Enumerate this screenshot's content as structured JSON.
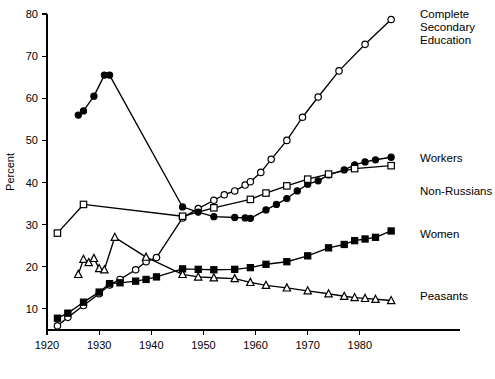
{
  "chart_data": {
    "type": "line",
    "title": "",
    "xlabel": "",
    "ylabel": "Percent",
    "xlim": [
      1920,
      1990
    ],
    "ylim": [
      5,
      80
    ],
    "xticks": [
      1920,
      1930,
      1940,
      1950,
      1960,
      1970,
      1980
    ],
    "xtick_labels": [
      "1920",
      "1930",
      "1940",
      "1950",
      "1960",
      "1970",
      "1980"
    ],
    "yticks": [
      10,
      20,
      30,
      40,
      50,
      60,
      70,
      80
    ],
    "ytick_labels": [
      "10",
      "20",
      "30",
      "40",
      "50",
      "60",
      "70",
      "80"
    ],
    "grid": false,
    "legend_position": "right-inline-labels",
    "series": [
      {
        "name": "Complete Secondary Education",
        "marker": "open-circle",
        "label": "Complete Secondary Education",
        "label_lines": [
          "Complete",
          "Secondary",
          "Education"
        ],
        "points": [
          [
            1922,
            6.0
          ],
          [
            1924,
            8.0
          ],
          [
            1927,
            10.8
          ],
          [
            1930,
            13.6
          ],
          [
            1932,
            15.7
          ],
          [
            1934,
            17.0
          ],
          [
            1937,
            19.3
          ],
          [
            1939,
            21.2
          ],
          [
            1941,
            22.2
          ],
          [
            1946,
            31.6
          ],
          [
            1949,
            33.8
          ],
          [
            1952,
            35.8
          ],
          [
            1954,
            37.1
          ],
          [
            1956,
            38.0
          ],
          [
            1958,
            39.4
          ],
          [
            1959,
            40.2
          ],
          [
            1961,
            42.4
          ],
          [
            1963,
            45.5
          ],
          [
            1966,
            50.0
          ],
          [
            1969,
            55.5
          ],
          [
            1972,
            60.3
          ],
          [
            1976,
            66.5
          ],
          [
            1981,
            72.8
          ],
          [
            1986,
            78.7
          ]
        ]
      },
      {
        "name": "Workers",
        "marker": "filled-circle",
        "label": "Workers",
        "label_lines": [
          "Workers"
        ],
        "points": [
          [
            1926,
            56.0
          ],
          [
            1927,
            57.0
          ],
          [
            1929,
            60.5
          ],
          [
            1931,
            65.5
          ],
          [
            1932,
            65.5
          ],
          [
            1946,
            34.2
          ],
          [
            1949,
            33.0
          ],
          [
            1952,
            31.9
          ],
          [
            1956,
            31.7
          ],
          [
            1958,
            31.6
          ],
          [
            1959,
            31.5
          ],
          [
            1962,
            33.5
          ],
          [
            1964,
            34.8
          ],
          [
            1966,
            36.2
          ],
          [
            1968,
            38.0
          ],
          [
            1970,
            39.6
          ],
          [
            1972,
            40.4
          ],
          [
            1974,
            41.8
          ],
          [
            1977,
            43.0
          ],
          [
            1979,
            44.2
          ],
          [
            1981,
            44.9
          ],
          [
            1983,
            45.4
          ],
          [
            1986,
            46.0
          ]
        ]
      },
      {
        "name": "Non-Russians",
        "marker": "open-square",
        "label": "Non-Russians",
        "label_lines": [
          "Non-Russians"
        ],
        "points": [
          [
            1922,
            28.0
          ],
          [
            1927,
            34.8
          ],
          [
            1946,
            32.0
          ],
          [
            1952,
            34.0
          ],
          [
            1959,
            36.0
          ],
          [
            1962,
            37.5
          ],
          [
            1966,
            39.2
          ],
          [
            1970,
            40.8
          ],
          [
            1974,
            42.0
          ],
          [
            1979,
            43.3
          ],
          [
            1986,
            44.0
          ]
        ]
      },
      {
        "name": "Women",
        "marker": "filled-square",
        "label": "Women",
        "label_lines": [
          "Women"
        ],
        "points": [
          [
            1922,
            7.8
          ],
          [
            1924,
            9.0
          ],
          [
            1927,
            11.6
          ],
          [
            1930,
            14.0
          ],
          [
            1932,
            16.0
          ],
          [
            1934,
            16.2
          ],
          [
            1937,
            16.6
          ],
          [
            1939,
            17.0
          ],
          [
            1941,
            17.6
          ],
          [
            1946,
            19.5
          ],
          [
            1949,
            19.4
          ],
          [
            1952,
            19.3
          ],
          [
            1956,
            19.4
          ],
          [
            1959,
            19.8
          ],
          [
            1962,
            20.6
          ],
          [
            1966,
            21.2
          ],
          [
            1970,
            22.6
          ],
          [
            1974,
            24.5
          ],
          [
            1977,
            25.3
          ],
          [
            1979,
            26.2
          ],
          [
            1981,
            26.6
          ],
          [
            1983,
            27.0
          ],
          [
            1986,
            28.5
          ]
        ]
      },
      {
        "name": "Peasants",
        "marker": "open-triangle",
        "label": "Peasants",
        "label_lines": [
          "Peasants"
        ],
        "points": [
          [
            1926,
            18.2
          ],
          [
            1927,
            21.8
          ],
          [
            1928,
            21.0
          ],
          [
            1929,
            22.0
          ],
          [
            1930,
            19.6
          ],
          [
            1931,
            19.3
          ],
          [
            1933,
            27.0
          ],
          [
            1939,
            22.3
          ],
          [
            1946,
            18.2
          ],
          [
            1949,
            17.6
          ],
          [
            1952,
            17.4
          ],
          [
            1956,
            17.2
          ],
          [
            1959,
            16.3
          ],
          [
            1962,
            15.6
          ],
          [
            1966,
            15.0
          ],
          [
            1970,
            14.3
          ],
          [
            1974,
            13.6
          ],
          [
            1977,
            13.0
          ],
          [
            1979,
            12.7
          ],
          [
            1981,
            12.5
          ],
          [
            1983,
            12.3
          ],
          [
            1986,
            12.0
          ]
        ]
      }
    ],
    "series_labels": [
      {
        "name": "Complete Secondary Education",
        "lines": [
          "Complete",
          "Secondary",
          "Education"
        ],
        "x": 420,
        "y": 18
      },
      {
        "name": "Workers",
        "lines": [
          "Workers"
        ],
        "x": 420,
        "y": 162
      },
      {
        "name": "Non-Russians",
        "lines": [
          "Non-Russians"
        ],
        "x": 420,
        "y": 195
      },
      {
        "name": "Women",
        "lines": [
          "Women"
        ],
        "x": 420,
        "y": 238
      },
      {
        "name": "Peasants",
        "lines": [
          "Peasants"
        ],
        "x": 420,
        "y": 300
      }
    ]
  }
}
